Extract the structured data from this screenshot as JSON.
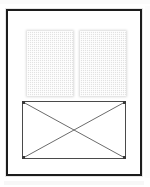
{
  "document": {
    "kind": "page-layout-thumbnail",
    "title": "Page layout thumbnail",
    "description": "Scanned page thumbnail showing two greyed text columns above a crossed-box image placeholder",
    "background_color": "#ffffff"
  },
  "page_frame": {
    "name": "page-border",
    "border_color": "#1c1c1c",
    "border_width": "2px",
    "fill_color": "#ffffff",
    "left": 6,
    "top": 9,
    "width": 136,
    "height": 167
  },
  "content_blocks": [
    {
      "name": "text-column-left",
      "type": "text-block",
      "fill_color": "#e2e2e2",
      "pattern": "checkerboard-dither",
      "left": 19,
      "top": 20,
      "width": 46,
      "height": 65
    },
    {
      "name": "text-column-right",
      "type": "text-block",
      "fill_color": "#e2e2e2",
      "pattern": "checkerboard-dither",
      "left": 72,
      "top": 20,
      "width": 46,
      "height": 65
    },
    {
      "name": "image-placeholder",
      "type": "image-frame",
      "stroke_color": "#4a4a4a",
      "diagonal_color": "#5a5a5a",
      "fill_color": "#ffffff",
      "left": 14,
      "top": 90,
      "width": 104,
      "height": 58,
      "marks": "crossed-diagonals"
    }
  ],
  "artifacts": {
    "scan_noise_color": "#f3f3f3",
    "halo_color": "#e6e6e6"
  }
}
